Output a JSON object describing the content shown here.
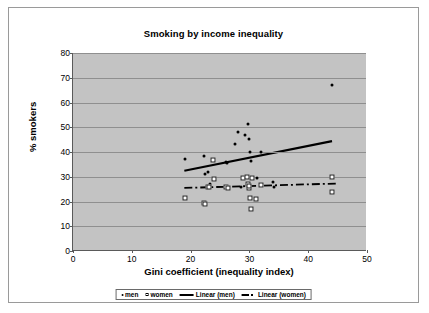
{
  "chart_data": {
    "type": "scatter",
    "title": "Smoking by income inequality",
    "xlabel": "Gini coefficient (inequality index)",
    "ylabel": "% smokers",
    "xlim": [
      0,
      50
    ],
    "ylim": [
      0,
      80
    ],
    "xticks": [
      0,
      10,
      20,
      30,
      40,
      50
    ],
    "yticks": [
      0,
      10,
      20,
      30,
      40,
      50,
      60,
      70,
      80
    ],
    "grid": "horizontal",
    "legend_position": "bottom",
    "series": [
      {
        "name": "men",
        "marker": "filled-dot",
        "color": "#000000",
        "points": [
          [
            19.0,
            37.0
          ],
          [
            22.3,
            38.2
          ],
          [
            22.4,
            31.0
          ],
          [
            22.9,
            32.0
          ],
          [
            23.3,
            27.0
          ],
          [
            26.0,
            35.8
          ],
          [
            26.2,
            35.6
          ],
          [
            27.6,
            43.2
          ],
          [
            28.0,
            48.2
          ],
          [
            28.6,
            26.0
          ],
          [
            29.2,
            46.8
          ],
          [
            29.7,
            51.3
          ],
          [
            30.0,
            45.2
          ],
          [
            30.1,
            40.2
          ],
          [
            30.2,
            36.4
          ],
          [
            30.4,
            29.5
          ],
          [
            31.3,
            29.4
          ],
          [
            32.0,
            40.0
          ],
          [
            34.0,
            28.0
          ],
          [
            34.2,
            26.0
          ],
          [
            44.0,
            67.0
          ]
        ]
      },
      {
        "name": "women",
        "marker": "open-square",
        "color": "#ffffff",
        "points": [
          [
            19.0,
            21.3
          ],
          [
            22.2,
            19.4
          ],
          [
            22.5,
            19.1
          ],
          [
            23.0,
            26.0
          ],
          [
            23.2,
            25.7
          ],
          [
            23.8,
            36.8
          ],
          [
            24.0,
            29.0
          ],
          [
            26.0,
            25.8
          ],
          [
            26.4,
            25.6
          ],
          [
            28.9,
            29.5
          ],
          [
            29.6,
            29.8
          ],
          [
            29.8,
            27.0
          ],
          [
            29.9,
            25.3
          ],
          [
            30.0,
            26.4
          ],
          [
            30.1,
            21.3
          ],
          [
            30.2,
            17.0
          ],
          [
            30.4,
            29.6
          ],
          [
            31.2,
            21.0
          ],
          [
            32.0,
            26.8
          ],
          [
            44.0,
            30.1
          ],
          [
            44.1,
            23.8
          ]
        ]
      }
    ],
    "trendlines": [
      {
        "name": "Linear (men)",
        "style": "solid",
        "color": "#000000",
        "x0": 19.0,
        "y0": 32.2,
        "x1": 44.2,
        "y1": 44.2
      },
      {
        "name": "Linear (women)",
        "style": "dash-dot",
        "color": "#000000",
        "x0": 19.0,
        "y0": 25.2,
        "x1": 45.0,
        "y1": 27.0
      }
    ],
    "legend": [
      {
        "label": "men",
        "marker": "filled-dot"
      },
      {
        "label": "women",
        "marker": "open-square"
      },
      {
        "label": "Linear (men)",
        "marker": "solid-line"
      },
      {
        "label": "Linear (women)",
        "marker": "dash-dot-line"
      }
    ]
  },
  "style": {
    "plot_background": "#c3c3c3",
    "gridline_color": "#8f8f8f",
    "axis_color": "#5a5a5a",
    "frame_color": "#9a9a9a",
    "page_background": "#ffffff"
  }
}
